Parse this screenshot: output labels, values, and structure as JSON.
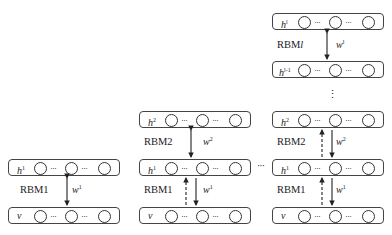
{
  "diagram": {
    "type": "stacked RBM / deep belief network greedy layer-wise training",
    "columns": [
      {
        "id": "stage1",
        "layers": [
          {
            "name": "h",
            "sup": "1"
          },
          {
            "name": "v",
            "sup": ""
          }
        ],
        "rbms": [
          {
            "label": "RBM1",
            "weight": "w",
            "weight_sup": "1",
            "arrow": "bidirectional"
          }
        ]
      },
      {
        "id": "stage2",
        "layers": [
          {
            "name": "h",
            "sup": "2"
          },
          {
            "name": "h",
            "sup": "1"
          },
          {
            "name": "v",
            "sup": ""
          }
        ],
        "rbms": [
          {
            "label": "RBM2",
            "weight": "w",
            "weight_sup": "2",
            "arrow": "bidirectional"
          },
          {
            "label": "RBM1",
            "weight": "w",
            "weight_sup": "1",
            "arrow": "down solid, up dashed"
          }
        ]
      },
      {
        "id": "stageL",
        "layers": [
          {
            "name": "h",
            "sup": "l"
          },
          {
            "name": "h",
            "sup": "l-1"
          },
          {
            "name": "h",
            "sup": "2"
          },
          {
            "name": "h",
            "sup": "1"
          },
          {
            "name": "v",
            "sup": ""
          }
        ],
        "rbms": [
          {
            "label": "RBMl",
            "weight": "w",
            "weight_sup": "l",
            "arrow": "bidirectional"
          },
          {
            "label": "RBM2",
            "weight": "w",
            "weight_sup": "2",
            "arrow": "down solid, up dashed"
          },
          {
            "label": "RBM1",
            "weight": "w",
            "weight_sup": "1",
            "arrow": "down solid, up dashed"
          }
        ]
      }
    ],
    "node_separator": "···",
    "between_columns": "···",
    "vertical_ellipsis": "⋮"
  },
  "labels": {
    "c1_h1": "h",
    "c1_h1_sup": "1",
    "c1_v": "v",
    "c1_rbm1": "RBM1",
    "c1_w1": "w",
    "c1_w1_sup": "1",
    "c2_h2": "h",
    "c2_h2_sup": "2",
    "c2_h1": "h",
    "c2_h1_sup": "1",
    "c2_v": "v",
    "c2_rbm2": "RBM2",
    "c2_w2": "w",
    "c2_w2_sup": "2",
    "c2_rbm1": "RBM1",
    "c2_w1": "w",
    "c2_w1_sup": "1",
    "c3_hl": "h",
    "c3_hl_sup": "l",
    "c3_hl1": "h",
    "c3_hl1_sup": "l-1",
    "c3_h2": "h",
    "c3_h2_sup": "2",
    "c3_h1": "h",
    "c3_h1_sup": "1",
    "c3_v": "v",
    "c3_rbml": "RBM",
    "c3_rbml_l": "l",
    "c3_wl": "w",
    "c3_wl_sup": "l",
    "c3_rbm2": "RBM2",
    "c3_w2": "w",
    "c3_w2_sup": "2",
    "c3_rbm1": "RBM1",
    "c3_w1": "w",
    "c3_w1_sup": "1",
    "dots": "···",
    "between": "···",
    "vdots": "⋮"
  }
}
